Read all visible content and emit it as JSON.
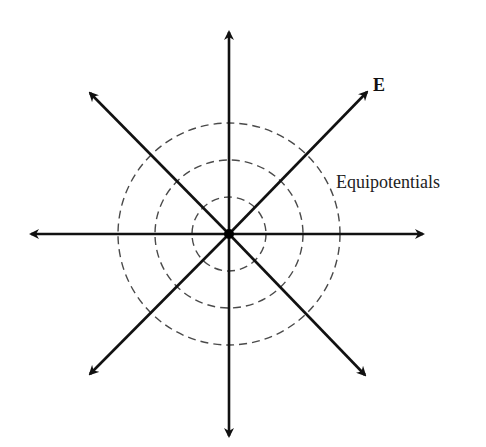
{
  "diagram": {
    "labels": {
      "field": "E",
      "equipotentials": "Equipotentials"
    },
    "center": {
      "x": 229,
      "y": 234
    },
    "charge_dot_radius": 5,
    "equipotential_radii": [
      37,
      74,
      111
    ],
    "field_lines": [
      {
        "direction": "up",
        "tip": {
          "x": 229,
          "y": 30
        }
      },
      {
        "direction": "down",
        "tip": {
          "x": 229,
          "y": 438
        }
      },
      {
        "direction": "left",
        "tip": {
          "x": 29,
          "y": 234
        }
      },
      {
        "direction": "right",
        "tip": {
          "x": 425,
          "y": 234
        }
      },
      {
        "direction": "up-left",
        "tip": {
          "x": 88,
          "y": 91
        }
      },
      {
        "direction": "up-right",
        "tip": {
          "x": 369,
          "y": 90
        }
      },
      {
        "direction": "down-left",
        "tip": {
          "x": 88,
          "y": 376
        }
      },
      {
        "direction": "down-right",
        "tip": {
          "x": 367,
          "y": 377
        }
      }
    ],
    "colors": {
      "lines": "#111111",
      "equipotentials": "#4a4a4a",
      "background": "#ffffff"
    }
  }
}
